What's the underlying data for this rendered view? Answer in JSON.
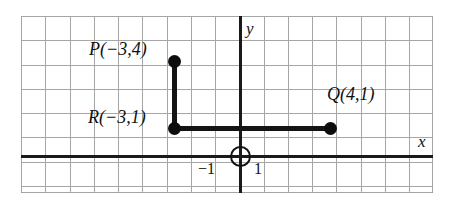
{
  "figure": {
    "axes": {
      "x_letter": "x",
      "y_letter": "y"
    },
    "ticks": {
      "negative_one": "−1",
      "positive_one": "1"
    },
    "points": [
      {
        "name": "P",
        "label": "P(−3,4)",
        "x": -3,
        "y": 4
      },
      {
        "name": "R",
        "label": "R(−3,1)",
        "x": -3,
        "y": 1
      },
      {
        "name": "Q",
        "label": "Q(4,1)",
        "x": 4,
        "y": 1
      }
    ],
    "segments": [
      {
        "from": "P",
        "to": "R",
        "orientation": "vertical"
      },
      {
        "from": "R",
        "to": "Q",
        "orientation": "horizontal"
      }
    ],
    "origin_marker": "open-circle"
  },
  "chart_data": {
    "type": "scatter",
    "title": "",
    "xlabel": "x",
    "ylabel": "y",
    "grid": true,
    "legend": "none",
    "xlim": [
      -9,
      8
    ],
    "ylim": [
      -2,
      6
    ],
    "xticks": [
      -1,
      1
    ],
    "xticklabels": [
      "−1",
      "1"
    ],
    "yticks": [],
    "yticklabels": [],
    "points": [
      {
        "label": "P(−3,4)",
        "x": -3,
        "y": 4
      },
      {
        "label": "R(−3,1)",
        "x": -3,
        "y": 1
      },
      {
        "label": "Q(4,1)",
        "x": 4,
        "y": 1
      }
    ],
    "series": [
      {
        "name": "PR segment",
        "x": [
          -3,
          -3
        ],
        "values": [
          4,
          1
        ]
      },
      {
        "name": "RQ segment",
        "x": [
          -3,
          4
        ],
        "values": [
          1,
          1
        ]
      }
    ],
    "annotations": [
      {
        "text": "P(−3,4)",
        "x": -3,
        "y": 4
      },
      {
        "text": "R(−3,1)",
        "x": -3,
        "y": 1
      },
      {
        "text": "Q(4,1)",
        "x": 4,
        "y": 1
      },
      {
        "text": "−1",
        "x": -1,
        "y": -0.35
      },
      {
        "text": "1",
        "x": 1,
        "y": -0.35
      },
      {
        "text": "y",
        "x": 0.4,
        "y": 5.5
      },
      {
        "text": "x",
        "x": 7.4,
        "y": 0.6
      }
    ],
    "colors": {
      "grid": "#9a9a9a",
      "axis": "#1a1a1a",
      "point": "#0d0d0d",
      "segment": "#141414",
      "background": "#ffffff"
    }
  }
}
